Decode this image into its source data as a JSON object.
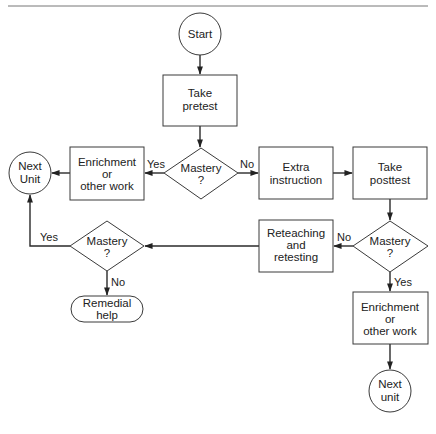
{
  "diagram": {
    "type": "flowchart",
    "nodes": {
      "start": {
        "shape": "circle",
        "lines": [
          "Start"
        ]
      },
      "pretest": {
        "shape": "rect",
        "lines": [
          "Take",
          "pretest"
        ]
      },
      "mastery1": {
        "shape": "diamond",
        "lines": [
          "Mastery",
          "?"
        ]
      },
      "enrichment1": {
        "shape": "rect",
        "lines": [
          "Enrichment",
          "or",
          "other work"
        ]
      },
      "next_unit_left": {
        "shape": "circle",
        "lines": [
          "Next",
          "Unit"
        ]
      },
      "extra_instruction": {
        "shape": "rect",
        "lines": [
          "Extra",
          "instruction"
        ]
      },
      "posttest": {
        "shape": "rect",
        "lines": [
          "Take",
          "posttest"
        ]
      },
      "mastery2": {
        "shape": "diamond",
        "lines": [
          "Mastery",
          "?"
        ]
      },
      "reteaching": {
        "shape": "rect",
        "lines": [
          "Reteaching",
          "and",
          "retesting"
        ]
      },
      "mastery3": {
        "shape": "diamond",
        "lines": [
          "Mastery",
          "?"
        ]
      },
      "remedial": {
        "shape": "terminal",
        "lines": [
          "Remedial",
          "help"
        ]
      },
      "enrichment2": {
        "shape": "rect",
        "lines": [
          "Enrichment",
          "or",
          "other work"
        ]
      },
      "next_unit_bottom": {
        "shape": "circle",
        "lines": [
          "Next",
          "unit"
        ]
      }
    },
    "edges": [
      {
        "from": "start",
        "to": "pretest",
        "label": ""
      },
      {
        "from": "pretest",
        "to": "mastery1",
        "label": ""
      },
      {
        "from": "mastery1",
        "to": "enrichment1",
        "label": "Yes"
      },
      {
        "from": "enrichment1",
        "to": "next_unit_left",
        "label": ""
      },
      {
        "from": "mastery1",
        "to": "extra_instruction",
        "label": "No"
      },
      {
        "from": "extra_instruction",
        "to": "posttest",
        "label": ""
      },
      {
        "from": "posttest",
        "to": "mastery2",
        "label": ""
      },
      {
        "from": "mastery2",
        "to": "reteaching",
        "label": "No"
      },
      {
        "from": "mastery2",
        "to": "enrichment2",
        "label": "Yes"
      },
      {
        "from": "reteaching",
        "to": "mastery3",
        "label": ""
      },
      {
        "from": "mastery3",
        "to": "next_unit_left",
        "label": "Yes"
      },
      {
        "from": "mastery3",
        "to": "remedial",
        "label": "No"
      },
      {
        "from": "enrichment2",
        "to": "next_unit_bottom",
        "label": ""
      }
    ],
    "edge_labels": {
      "m1_yes": "Yes",
      "m1_no": "No",
      "m2_no": "No",
      "m2_yes": "Yes",
      "m3_yes": "Yes",
      "m3_no": "No"
    }
  }
}
